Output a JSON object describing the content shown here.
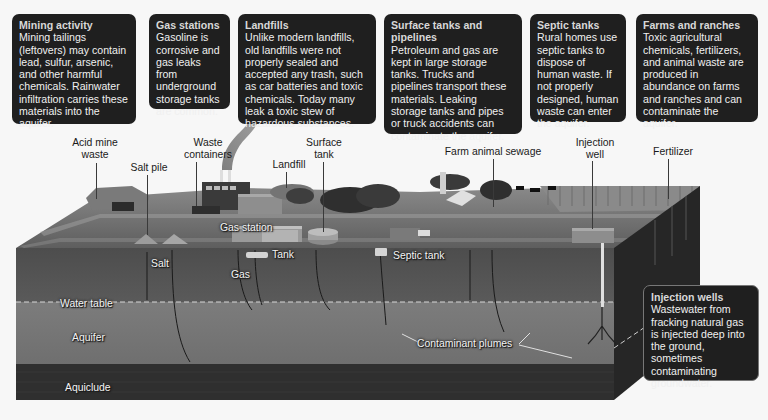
{
  "callouts": [
    {
      "id": "mining",
      "title": "Mining activity",
      "body": "Mining tailings (leftovers) may contain lead, sulfur, arsenic, and other harmful chemicals. Rainwater infiltration carries these materials into the aquifer."
    },
    {
      "id": "gas-stations",
      "title": "Gas stations",
      "body": "Gasoline is corrosive and gas leaks from underground storage tanks are common."
    },
    {
      "id": "landfills",
      "title": "Landfills",
      "body": "Unlike modern landfills, old landfills were not properly sealed and accepted any trash, such as car batteries and toxic chemicals. Today many leak a toxic stew of hazardous substances."
    },
    {
      "id": "surface-tanks",
      "title": "Surface tanks and pipelines",
      "body": "Petroleum and gas are kept in large storage tanks. Trucks and pipelines transport these materials. Leaking storage tanks and pipes or truck accidents can contaminate the aquifer."
    },
    {
      "id": "septic-tanks",
      "title": "Septic tanks",
      "body": "Rural homes use septic tanks to dispose of human waste. If not properly designed, human waste can enter the aquifer."
    },
    {
      "id": "farms",
      "title": "Farms and ranches",
      "body": "Toxic agricultural chemicals, fertilizers, and animal waste are produced in abundance on farms and ranches and can contaminate the aquifer."
    },
    {
      "id": "injection-wells",
      "title": "Injection wells",
      "body": "Wastewater from fracking natural gas is injected deep into the ground, sometimes contaminating groundwater."
    }
  ],
  "surface_labels": {
    "acid_mine_waste": "Acid mine waste",
    "salt_pile": "Salt pile",
    "waste_containers": "Waste containers",
    "landfill": "Landfill",
    "surface_tank": "Surface tank",
    "farm_animal_sewage": "Farm animal sewage",
    "injection_well": "Injection well",
    "fertilizer": "Fertilizer",
    "gas_station": "Gas station"
  },
  "underground_labels": {
    "salt": "Salt",
    "gas": "Gas",
    "tank": "Tank",
    "septic_tank": "Septic tank",
    "water_table": "Water table",
    "aquifer": "Aquifer",
    "contaminant_plumes": "Contaminant plumes",
    "aquiclude": "Aquiclude"
  },
  "colors": {
    "callout_bg": "#1f1f1f",
    "soil": "#545454",
    "aquifer": "#787878",
    "aquiclude": "#2e2e2e",
    "ground_surface": "#6e6e6e",
    "side_face": "#262626"
  }
}
